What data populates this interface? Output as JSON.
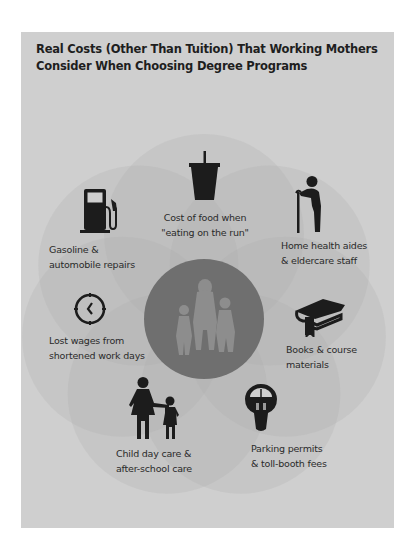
{
  "title": {
    "line1": "Real Costs (Other Than Tuition) That Working Mothers",
    "line2": "Consider When Choosing Degree Programs"
  },
  "colors": {
    "panel_bg": "#cfcfcf",
    "petal_fill": "#bdbdbd",
    "center_fill": "#6f6f6f",
    "center_figures": "#8d8d8d",
    "icon_color": "#1c1c1c",
    "text_color": "#2a2a2a"
  },
  "center": {
    "icon": "family-icon"
  },
  "items": [
    {
      "icon": "drink-cup-icon",
      "line1": "Cost of food when",
      "line2": "\"eating on the run\""
    },
    {
      "icon": "elderly-person-cane-icon",
      "line1": "Home health aides",
      "line2": "& eldercare staff"
    },
    {
      "icon": "book-graduation-cap-icon",
      "line1": "Books & course",
      "line2": "materials"
    },
    {
      "icon": "parking-meter-icon",
      "line1": "Parking permits",
      "line2": "& toll-booth fees"
    },
    {
      "icon": "mother-child-icon",
      "line1": "Child day care &",
      "line2": "after-school care"
    },
    {
      "icon": "clock-icon",
      "line1": "Lost wages from",
      "line2": "shortened work days"
    },
    {
      "icon": "gas-pump-icon",
      "line1": "Gasoline &",
      "line2": "automobile repairs"
    }
  ]
}
